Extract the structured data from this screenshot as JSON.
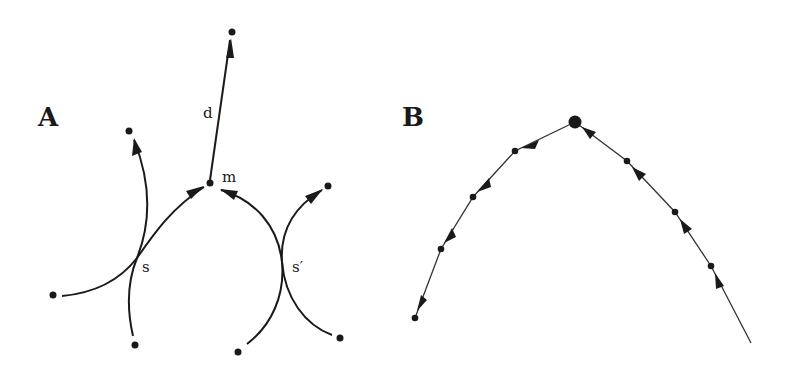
{
  "panels": [
    {
      "label": "A",
      "nodes": {
        "m": "m",
        "d": "d",
        "s": "s",
        "s_prime": "s′"
      }
    },
    {
      "label": "B"
    }
  ],
  "colors": {
    "ink": "#1a1a1a",
    "background": "#ffffff"
  }
}
